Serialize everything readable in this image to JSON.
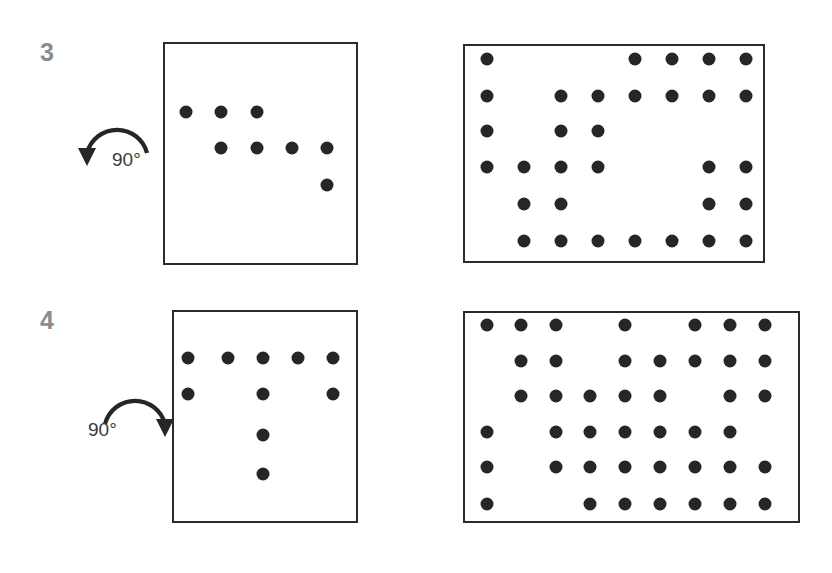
{
  "figure": {
    "background_color": "#ffffff",
    "ink_color": "#262626",
    "panel_border_color": "#2b2b2b",
    "index_color": "#8c8c8c",
    "dot_radius_px": 6.5
  },
  "rows": [
    {
      "index_label": "3",
      "index_pos": {
        "x": 40,
        "y": 40
      },
      "rotation": {
        "label": "90°",
        "direction": "counter-clockwise",
        "arrow_icon": "rotate-left-icon",
        "label_pos": {
          "x": 112,
          "y": 150
        },
        "arrow_box": {
          "x": 78,
          "y": 104,
          "w": 78,
          "h": 62
        }
      },
      "left_panel": {
        "name": "source-grid",
        "box": {
          "x": 163,
          "y": 42,
          "w": 195,
          "h": 223
        },
        "cols": 6,
        "rows": 6,
        "col_x": [
          186,
          221,
          257,
          292,
          327,
          362
        ],
        "row_y": [
          112,
          148,
          185,
          221
        ],
        "dots": [
          {
            "col": 1,
            "row": 1
          },
          {
            "col": 2,
            "row": 1
          },
          {
            "col": 3,
            "row": 1
          },
          {
            "col": 2,
            "row": 2
          },
          {
            "col": 3,
            "row": 2
          },
          {
            "col": 4,
            "row": 2
          },
          {
            "col": 5,
            "row": 2
          },
          {
            "col": 5,
            "row": 3
          }
        ],
        "dot_count": 8
      },
      "right_panel": {
        "name": "result-grid",
        "box": {
          "x": 463,
          "y": 44,
          "w": 302,
          "h": 219
        },
        "cols": 8,
        "rows": 6,
        "col_x": [
          487,
          524,
          561,
          598,
          635,
          672,
          709,
          746
        ],
        "row_y": [
          59,
          96,
          131,
          167,
          204,
          241
        ],
        "dots": [
          {
            "col": 1,
            "row": 1
          },
          {
            "col": 5,
            "row": 1
          },
          {
            "col": 6,
            "row": 1
          },
          {
            "col": 7,
            "row": 1
          },
          {
            "col": 8,
            "row": 1
          },
          {
            "col": 1,
            "row": 2
          },
          {
            "col": 3,
            "row": 2
          },
          {
            "col": 4,
            "row": 2
          },
          {
            "col": 5,
            "row": 2
          },
          {
            "col": 6,
            "row": 2
          },
          {
            "col": 7,
            "row": 2
          },
          {
            "col": 8,
            "row": 2
          },
          {
            "col": 1,
            "row": 3
          },
          {
            "col": 3,
            "row": 3
          },
          {
            "col": 4,
            "row": 3
          },
          {
            "col": 1,
            "row": 4
          },
          {
            "col": 2,
            "row": 4
          },
          {
            "col": 3,
            "row": 4
          },
          {
            "col": 4,
            "row": 4
          },
          {
            "col": 7,
            "row": 4
          },
          {
            "col": 8,
            "row": 4
          },
          {
            "col": 2,
            "row": 5
          },
          {
            "col": 3,
            "row": 5
          },
          {
            "col": 7,
            "row": 5
          },
          {
            "col": 8,
            "row": 5
          },
          {
            "col": 2,
            "row": 6
          },
          {
            "col": 3,
            "row": 6
          },
          {
            "col": 4,
            "row": 6
          },
          {
            "col": 5,
            "row": 6
          },
          {
            "col": 6,
            "row": 6
          },
          {
            "col": 7,
            "row": 6
          },
          {
            "col": 8,
            "row": 6
          }
        ],
        "dot_count": 32
      }
    },
    {
      "index_label": "4",
      "index_pos": {
        "x": 40,
        "y": 308
      },
      "rotation": {
        "label": "90°",
        "direction": "clockwise",
        "arrow_icon": "rotate-right-icon",
        "label_pos": {
          "x": 88,
          "y": 420
        },
        "arrow_box": {
          "x": 96,
          "y": 375,
          "w": 78,
          "h": 62
        }
      },
      "left_panel": {
        "name": "source-grid",
        "box": {
          "x": 172,
          "y": 310,
          "w": 186,
          "h": 213
        },
        "cols": 5,
        "rows": 5,
        "col_x": [
          188,
          228,
          263,
          298,
          333
        ],
        "row_y": [
          358,
          394,
          435,
          474
        ],
        "dots": [
          {
            "col": 1,
            "row": 1
          },
          {
            "col": 2,
            "row": 1
          },
          {
            "col": 3,
            "row": 1
          },
          {
            "col": 4,
            "row": 1
          },
          {
            "col": 5,
            "row": 1
          },
          {
            "col": 1,
            "row": 2
          },
          {
            "col": 3,
            "row": 2
          },
          {
            "col": 5,
            "row": 2
          },
          {
            "col": 3,
            "row": 3
          },
          {
            "col": 3,
            "row": 4
          }
        ],
        "dot_count": 10
      },
      "right_panel": {
        "name": "result-grid",
        "box": {
          "x": 463,
          "y": 311,
          "w": 337,
          "h": 212
        },
        "cols": 9,
        "rows": 6,
        "col_x": [
          487,
          521,
          556,
          590,
          625,
          660,
          695,
          730,
          765
        ],
        "row_y": [
          325,
          361,
          396,
          432,
          467,
          504
        ],
        "dots": [
          {
            "col": 1,
            "row": 1
          },
          {
            "col": 2,
            "row": 1
          },
          {
            "col": 3,
            "row": 1
          },
          {
            "col": 5,
            "row": 1
          },
          {
            "col": 7,
            "row": 1
          },
          {
            "col": 8,
            "row": 1
          },
          {
            "col": 9,
            "row": 1
          },
          {
            "col": 2,
            "row": 2
          },
          {
            "col": 3,
            "row": 2
          },
          {
            "col": 5,
            "row": 2
          },
          {
            "col": 6,
            "row": 2
          },
          {
            "col": 7,
            "row": 2
          },
          {
            "col": 8,
            "row": 2
          },
          {
            "col": 9,
            "row": 2
          },
          {
            "col": 2,
            "row": 3
          },
          {
            "col": 3,
            "row": 3
          },
          {
            "col": 4,
            "row": 3
          },
          {
            "col": 5,
            "row": 3
          },
          {
            "col": 6,
            "row": 3
          },
          {
            "col": 8,
            "row": 3
          },
          {
            "col": 9,
            "row": 3
          },
          {
            "col": 1,
            "row": 4
          },
          {
            "col": 3,
            "row": 4
          },
          {
            "col": 4,
            "row": 4
          },
          {
            "col": 5,
            "row": 4
          },
          {
            "col": 6,
            "row": 4
          },
          {
            "col": 7,
            "row": 4
          },
          {
            "col": 8,
            "row": 4
          },
          {
            "col": 1,
            "row": 5
          },
          {
            "col": 3,
            "row": 5
          },
          {
            "col": 4,
            "row": 5
          },
          {
            "col": 5,
            "row": 5
          },
          {
            "col": 6,
            "row": 5
          },
          {
            "col": 7,
            "row": 5
          },
          {
            "col": 8,
            "row": 5
          },
          {
            "col": 9,
            "row": 5
          },
          {
            "col": 1,
            "row": 6
          },
          {
            "col": 4,
            "row": 6
          },
          {
            "col": 5,
            "row": 6
          },
          {
            "col": 6,
            "row": 6
          },
          {
            "col": 7,
            "row": 6
          },
          {
            "col": 8,
            "row": 6
          },
          {
            "col": 9,
            "row": 6
          }
        ],
        "dot_count": 43
      }
    }
  ]
}
